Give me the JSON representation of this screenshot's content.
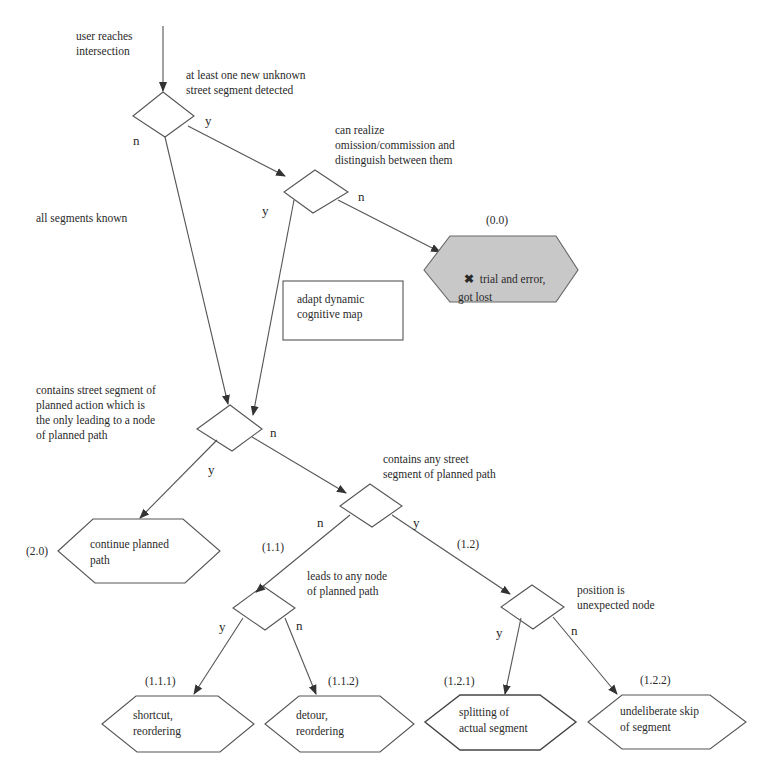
{
  "diagram": {
    "type": "flowchart",
    "start": {
      "label": "user reaches\nintersection"
    },
    "decisions": [
      {
        "id": "d1",
        "label": "at least one new unknown\nstreet segment detected"
      },
      {
        "id": "d2",
        "label": "can realize\nomission/commission and\ndistinguish between them"
      },
      {
        "id": "d3",
        "label": "contains street segment of\nplanned action which is\nthe only leading to a node\nof planned path"
      },
      {
        "id": "d4",
        "label": "contains any street\nsegment of planned path"
      },
      {
        "id": "d5",
        "label": "leads to any node\nof planned path"
      },
      {
        "id": "d6",
        "label": "position is\nunexpected node"
      }
    ],
    "process_box": {
      "label": "adapt dynamic\ncognitive map"
    },
    "edge_labels": {
      "d1_y": "y",
      "d1_n": "n",
      "all_known": "all segments known",
      "d2_y": "y",
      "d2_n": "n",
      "d3_y": "y",
      "d3_n": "n",
      "d4_y": "y",
      "d4_n": "n",
      "d5_y": "y",
      "d5_n": "n",
      "d6_y": "y",
      "d6_n": "n"
    },
    "branch_codes": {
      "c11": "(1.1)",
      "c12": "(1.2)"
    },
    "outcomes": [
      {
        "id": "o00",
        "code": "(0.0)",
        "label": "trial and error,\ngot lost",
        "icon": "x-mark-icon",
        "icon_glyph": "✖",
        "fill": "#c8c8c8"
      },
      {
        "id": "o20",
        "code": "(2.0)",
        "label": "continue planned\npath",
        "fill": "#ffffff"
      },
      {
        "id": "o111",
        "code": "(1.1.1)",
        "label": "shortcut,\nreordering",
        "fill": "#ffffff"
      },
      {
        "id": "o112",
        "code": "(1.1.2)",
        "label": "detour,\nreordering",
        "fill": "#ffffff"
      },
      {
        "id": "o121",
        "code": "(1.2.1)",
        "label": "splitting of\nactual segment",
        "fill": "#ffffff"
      },
      {
        "id": "o122",
        "code": "(1.2.2)",
        "label": "undeliberate skip\nof segment",
        "fill": "#ffffff"
      }
    ],
    "colors": {
      "line": "#555555",
      "gray_fill": "#c8c8c8",
      "text": "#2a2a2a"
    }
  }
}
